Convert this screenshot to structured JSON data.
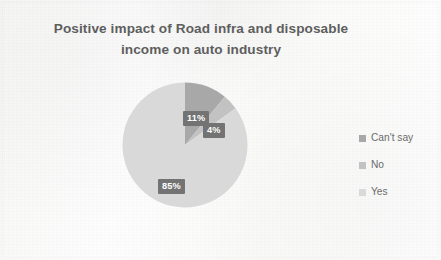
{
  "chart_data": {
    "type": "pie",
    "title": "Positive impact of Road infra and disposable income on auto industry",
    "title_lines": [
      "Positive impact of Road infra and disposable",
      "income on auto industry"
    ],
    "categories": [
      "Can't say",
      "No",
      "Yes"
    ],
    "values": [
      11,
      4,
      85
    ],
    "value_labels": [
      "11%",
      "4%",
      "85%"
    ],
    "units": "percent",
    "start_angle_deg": 0,
    "direction": "clockwise",
    "legend_position": "right",
    "grid": false,
    "xlabel": "",
    "ylabel": "",
    "slices": [
      {
        "name": "Can't say",
        "value": 11,
        "label": "11%",
        "color": "#a8a8a8"
      },
      {
        "name": "No",
        "value": 4,
        "label": "4%",
        "color": "#c2c2c2"
      },
      {
        "name": "Yes",
        "value": 85,
        "label": "85%",
        "color": "#d9d9d9"
      }
    ]
  },
  "title": {
    "line1": "Positive impact of Road infra and disposable",
    "line2": "income on auto industry"
  },
  "labels": {
    "cantsay": "11%",
    "no": "4%",
    "yes": "85%"
  },
  "legend": {
    "items": [
      {
        "label": "Can't say",
        "color": "#a8a8a8"
      },
      {
        "label": "No",
        "color": "#c2c2c2"
      },
      {
        "label": "Yes",
        "color": "#d9d9d9"
      }
    ]
  },
  "colors": {
    "background": "#fbfbfa",
    "title_text": "#5e5e5e",
    "legend_text": "#6b6b6b",
    "label_box": "#737373",
    "label_text": "#ffffff",
    "slice_cantsay": "#a8a8a8",
    "slice_no": "#c2c2c2",
    "slice_yes": "#d9d9d9"
  }
}
